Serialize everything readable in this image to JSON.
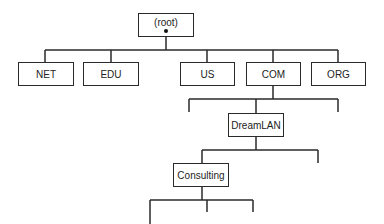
{
  "diagram": {
    "type": "tree",
    "title": "",
    "nodes": {
      "root": {
        "label": "(root)"
      },
      "net": {
        "label": "NET"
      },
      "edu": {
        "label": "EDU"
      },
      "us": {
        "label": "US"
      },
      "com": {
        "label": "COM"
      },
      "org": {
        "label": "ORG"
      },
      "dreamlan": {
        "label": "DreamLAN"
      },
      "consulting": {
        "label": "Consulting"
      }
    },
    "edges": [
      [
        "root",
        "net"
      ],
      [
        "root",
        "edu"
      ],
      [
        "root",
        "us"
      ],
      [
        "root",
        "com"
      ],
      [
        "root",
        "org"
      ],
      [
        "com",
        "(unlabeled)"
      ],
      [
        "com",
        "dreamlan"
      ],
      [
        "com",
        "(unlabeled)"
      ],
      [
        "dreamlan",
        "consulting"
      ],
      [
        "dreamlan",
        "(unlabeled)"
      ],
      [
        "consulting",
        "(unlabeled)"
      ],
      [
        "consulting",
        "(unlabeled)"
      ],
      [
        "consulting",
        "(unlabeled)"
      ]
    ],
    "colors": {
      "line": "#2a2a2a",
      "background": "#ffffff"
    }
  }
}
